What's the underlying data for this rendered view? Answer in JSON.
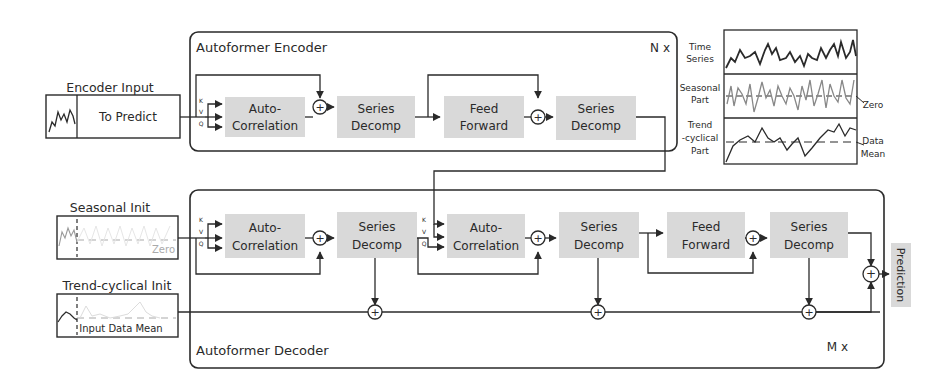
{
  "encoder": {
    "title": "Autoformer Encoder",
    "repeat": "N x",
    "blocks": [
      {
        "line1": "Auto-",
        "line2": "Correlation"
      },
      {
        "line1": "Series",
        "line2": "Decomp"
      },
      {
        "line1": "Feed",
        "line2": "Forward"
      },
      {
        "line1": "Series",
        "line2": "Decomp"
      }
    ],
    "qkv": [
      "K",
      "V",
      "Q"
    ]
  },
  "decoder": {
    "title": "Autoformer Decoder",
    "repeat": "M x",
    "blocks": [
      {
        "line1": "Auto-",
        "line2": "Correlation"
      },
      {
        "line1": "Series",
        "line2": "Decomp"
      },
      {
        "line1": "Auto-",
        "line2": "Correlation"
      },
      {
        "line1": "Series",
        "line2": "Decomp"
      },
      {
        "line1": "Feed",
        "line2": "Forward"
      },
      {
        "line1": "Series",
        "line2": "Decomp"
      }
    ],
    "qkv": [
      "K",
      "V",
      "Q"
    ]
  },
  "inputs": {
    "encoder_input": {
      "title": "Encoder Input",
      "label": "To Predict"
    },
    "seasonal_init": {
      "title": "Seasonal Init",
      "label": "Zero"
    },
    "trend_init": {
      "title": "Trend-cyclical Init",
      "label": "Input Data Mean"
    }
  },
  "output": {
    "label": "Prediction"
  },
  "legend": {
    "time_series": {
      "line1": "Time",
      "line2": "Series"
    },
    "seasonal": {
      "line1": "Seasonal",
      "line2": "Part",
      "annotation": "Zero"
    },
    "trend": {
      "line1": "Trend",
      "line2": "-cyclical",
      "line3": "Part",
      "annotation1": "Data",
      "annotation2": "Mean"
    }
  },
  "symbols": {
    "plus": "+"
  },
  "colors": {
    "block_fill": "#d9d9d9",
    "stroke": "#2a2a2a",
    "faded": "#aaaaaa"
  }
}
